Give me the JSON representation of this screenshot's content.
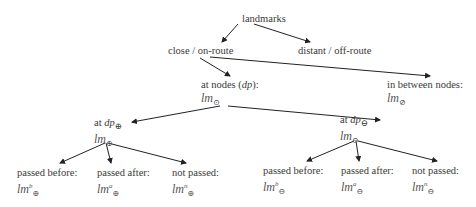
{
  "diagram": {
    "root": {
      "label": "landmarks"
    },
    "level1": [
      {
        "label": "close / on-route"
      },
      {
        "label": "distant / off-route"
      }
    ],
    "level2": [
      {
        "label": "at nodes (dp):",
        "symbol": "lm",
        "sub": "⊙"
      },
      {
        "label": "in between nodes:",
        "symbol": "lm",
        "sub": "⊘"
      }
    ],
    "level3": [
      {
        "label": "at dp⊕",
        "symbol": "lm",
        "sub": "⊕"
      },
      {
        "label": "at dp⊖",
        "symbol": "lm",
        "sub": "⊖"
      }
    ],
    "leaves": [
      {
        "label": "passed before:",
        "symbol": "lm",
        "sup": "b",
        "sub": "⊕"
      },
      {
        "label": "passed after:",
        "symbol": "lm",
        "sup": "a",
        "sub": "⊕"
      },
      {
        "label": "not passed:",
        "symbol": "lm",
        "sup": "n",
        "sub": "⊕"
      },
      {
        "label": "passed before:",
        "symbol": "lm",
        "sup": "b",
        "sub": "⊖"
      },
      {
        "label": "passed after:",
        "symbol": "lm",
        "sup": "a",
        "sub": "⊖"
      },
      {
        "label": "not passed:",
        "symbol": "lm",
        "sup": "n",
        "sub": "⊖"
      }
    ]
  }
}
